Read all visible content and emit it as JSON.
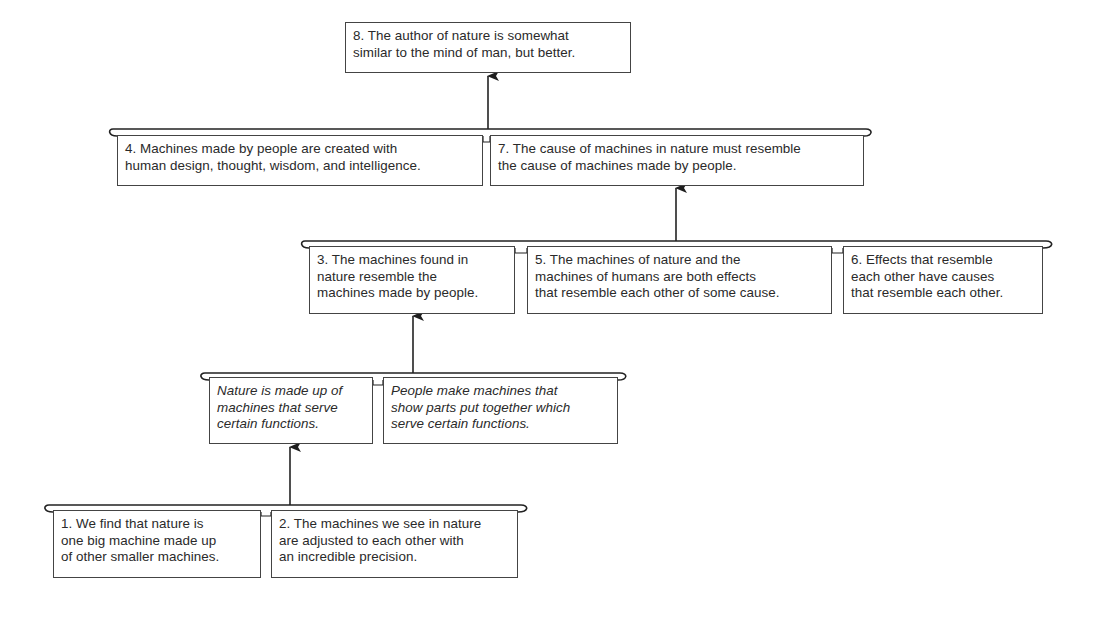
{
  "diagram": {
    "type": "argument-map",
    "conclusion": {
      "id": "8",
      "text": "8. The author of nature is somewhat\nsimilar to the mind of man, but better."
    },
    "levels": [
      {
        "name": "level-4",
        "supports": "8",
        "premises": [
          {
            "id": "4",
            "text": "4. Machines made by people are created with\nhuman design, thought, wisdom, and intelligence."
          },
          {
            "id": "7",
            "text": "7. The cause of machines in nature must resemble\nthe cause of machines made by people."
          }
        ]
      },
      {
        "name": "level-3",
        "supports": "7",
        "premises": [
          {
            "id": "3",
            "text": "3. The machines found in\nnature resemble the\nmachines made by people."
          },
          {
            "id": "5",
            "text": "5. The machines of nature and the\nmachines of humans are both effects\nthat resemble each other of some cause."
          },
          {
            "id": "6",
            "text": "6. Effects that resemble\neach other have causes\nthat resemble each other."
          }
        ]
      },
      {
        "name": "level-2",
        "supports": "3",
        "premises": [
          {
            "id": "implicit-a",
            "text": "Nature is made up of\nmachines that serve\ncertain functions.",
            "italic": true
          },
          {
            "id": "implicit-b",
            "text": "People make machines that\nshow parts put together which\nserve certain functions.",
            "italic": true
          }
        ]
      },
      {
        "name": "level-1",
        "supports": "implicit-a",
        "premises": [
          {
            "id": "1",
            "text": "1. We find that nature is\none big machine made up\nof other smaller machines."
          },
          {
            "id": "2",
            "text": "2. The machines we see in nature\nare adjusted to each other with\nan incredible precision."
          }
        ]
      }
    ],
    "colors": {
      "line": "#222222",
      "box_border": "#444444",
      "text": "#2a2a2a",
      "background": "#ffffff"
    }
  }
}
